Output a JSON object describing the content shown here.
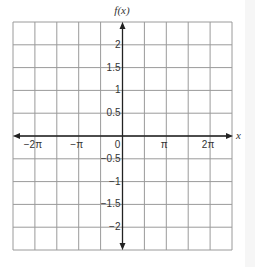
{
  "chart_data": {
    "type": "line",
    "title": "",
    "xlabel": "x",
    "ylabel": "f(x)",
    "xlim": [
      -7.854,
      7.854
    ],
    "ylim": [
      -2.5,
      2.5
    ],
    "grid": true,
    "x_ticks": [
      {
        "value": -6.2832,
        "label": "−2π"
      },
      {
        "value": -3.1416,
        "label": "−π"
      },
      {
        "value": 0,
        "label": "0"
      },
      {
        "value": 3.1416,
        "label": "π"
      },
      {
        "value": 6.2832,
        "label": "2π"
      }
    ],
    "y_ticks": [
      {
        "value": 2,
        "label": "2"
      },
      {
        "value": 1.5,
        "label": "1.5"
      },
      {
        "value": 1,
        "label": "1"
      },
      {
        "value": 0.5,
        "label": "0.5"
      },
      {
        "value": -0.5,
        "label": "−0.5"
      },
      {
        "value": -1,
        "label": "−1"
      },
      {
        "value": -1.5,
        "label": "−1.5"
      },
      {
        "value": -2,
        "label": "−2"
      }
    ],
    "series": [],
    "grid_columns": 10,
    "grid_rows": 10
  },
  "colors": {
    "grid": "#9a9a9a",
    "axis": "#222222",
    "text": "#333333"
  }
}
